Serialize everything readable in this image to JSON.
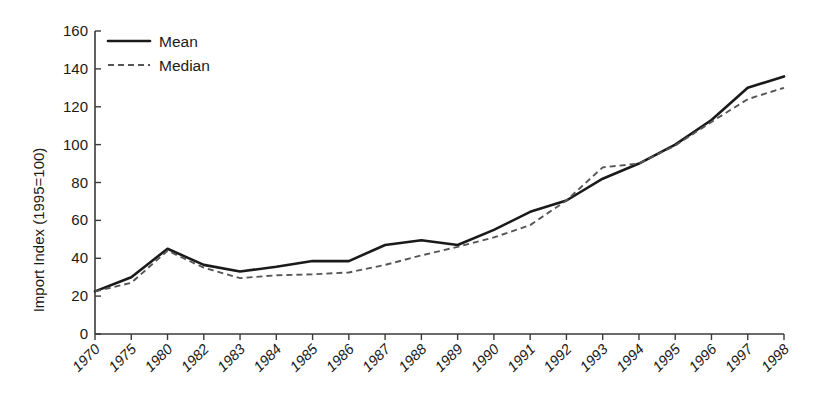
{
  "chart_data": {
    "type": "line",
    "title": "",
    "xlabel": "",
    "ylabel": "Import Index (1995=100)",
    "ylim": [
      0,
      160
    ],
    "ytick_step": 20,
    "yticks": [
      0,
      20,
      40,
      60,
      80,
      100,
      120,
      140,
      160
    ],
    "grid": false,
    "legend_position": "top-left",
    "categories": [
      "1970",
      "1975",
      "1980",
      "1982",
      "1983",
      "1984",
      "1985",
      "1986",
      "1987",
      "1988",
      "1989",
      "1990",
      "1991",
      "1992",
      "1993",
      "1994",
      "1995",
      "1996",
      "1997",
      "1998"
    ],
    "series": [
      {
        "name": "Mean",
        "style": "solid",
        "color": "#1a1a1a",
        "values": [
          22.5,
          30,
          45,
          36.5,
          33,
          35.5,
          38.5,
          38.5,
          47,
          49.5,
          47,
          55,
          64.5,
          70.5,
          82,
          90,
          100,
          113,
          130,
          136
        ]
      },
      {
        "name": "Median",
        "style": "dashed",
        "color": "#555555",
        "values": [
          22.5,
          27,
          44,
          35,
          29.5,
          31,
          31.5,
          32.5,
          36.5,
          41.5,
          46,
          51,
          57.5,
          70.5,
          88,
          90,
          99.5,
          112,
          124,
          130
        ]
      }
    ],
    "legend": [
      "Mean",
      "Median"
    ]
  },
  "axes": {
    "y_axis_title": "Import Index (1995=100)",
    "y_tick_labels": [
      "160",
      "140",
      "120",
      "100",
      "80",
      "60",
      "40",
      "20",
      "0"
    ],
    "x_tick_labels": [
      "1970",
      "1975",
      "1980",
      "1982",
      "1983",
      "1984",
      "1985",
      "1986",
      "1987",
      "1988",
      "1989",
      "1990",
      "1991",
      "1992",
      "1993",
      "1994",
      "1995",
      "1996",
      "1997",
      "1998"
    ]
  },
  "legend": {
    "entries": [
      {
        "label": "Mean",
        "style": "solid"
      },
      {
        "label": "Median",
        "style": "dashed"
      }
    ]
  },
  "colors": {
    "mean_line": "#1a1a1a",
    "median_line": "#555555",
    "axis": "#3a3a3a",
    "background": "#ffffff"
  }
}
